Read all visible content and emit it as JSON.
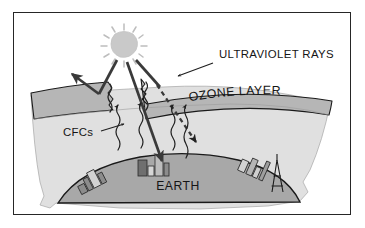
{
  "figure": {
    "type": "scientific-illustration",
    "frame_border_color": "#262626",
    "background_color": "#ffffff"
  },
  "labels": {
    "ultraviolet_rays": "ULTRAVIOLET RAYS",
    "ozone_layer": "OZONE LAYER",
    "cfcs": "CFCs",
    "earth": "EARTH"
  },
  "elements": {
    "sun": {
      "name": "sun",
      "fill": "#c9c9c9",
      "ray_ticks": 12
    },
    "ozone_band": {
      "name": "ozone-layer-band",
      "fill": "#b6b6b6",
      "stroke": "#1a1a1a",
      "gaps": 2,
      "gap_style": "jagged-tear"
    },
    "atmosphere": {
      "name": "atmosphere",
      "fill": "#e0e0e0",
      "stroke": "#9a9a9a"
    },
    "earth": {
      "name": "earth-dome",
      "fill": "#a8a8a8",
      "stroke": "#1a1a1a"
    },
    "uv_rays": {
      "name": "ultraviolet-ray-arrows",
      "color": "#3a3a3a",
      "incoming_count": 3,
      "reflected_count": 1,
      "penetrating_dashed_count": 1
    },
    "cfc_plumes": {
      "name": "cfc-wavy-arrows",
      "color": "#2a2a2a",
      "count": 5,
      "direction": "upward"
    },
    "cities": {
      "name": "city-skylines",
      "fill": "#8c8c8c",
      "stroke": "#2a2a2a",
      "left_cluster_buildings": 4,
      "center_cluster_buildings": 4,
      "right_cluster_buildings": 5,
      "landmark": "tower"
    }
  },
  "colors": {
    "ink": "#1a1a1a",
    "ozone_gray": "#b6b6b6",
    "atmosphere_gray": "#e0e0e0",
    "earth_gray": "#a8a8a8",
    "sun_gray": "#c9c9c9",
    "building_gray": "#8c8c8c"
  }
}
